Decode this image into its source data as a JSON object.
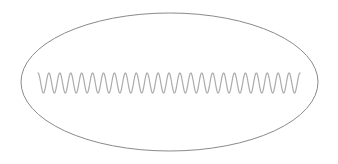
{
  "canvas": {
    "width": 338,
    "height": 164,
    "background": "#ffffff"
  },
  "ellipse": {
    "cx": 169.5,
    "cy": 82,
    "rx": 148.5,
    "ry": 69,
    "stroke": "#8a8a8a",
    "stroke_width": 1
  },
  "wave": {
    "type": "sine",
    "x_start": 38,
    "x_end": 300,
    "center_y": 83,
    "amplitude": 10,
    "cycles": 24,
    "start_phase": "peak",
    "stroke": "#ababab",
    "stroke_width": 1.2
  }
}
